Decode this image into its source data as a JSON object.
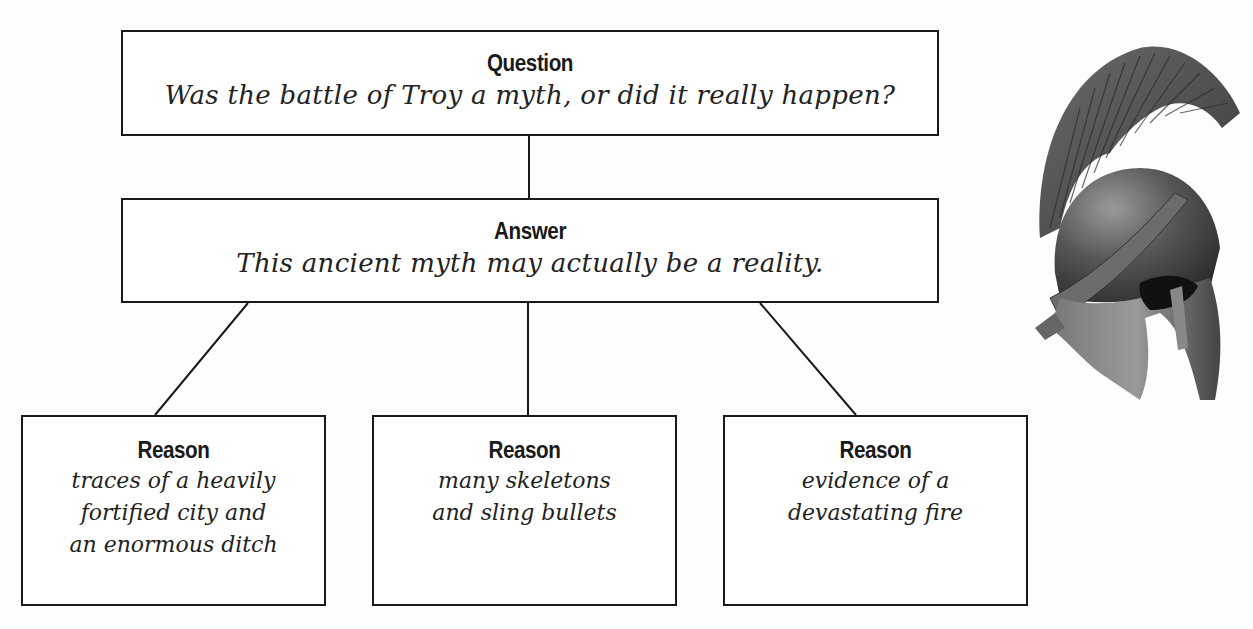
{
  "diagram": {
    "question": {
      "title": "Question",
      "text": "Was the battle of Troy a myth, or did it really happen?"
    },
    "answer": {
      "title": "Answer",
      "text": "This ancient myth may actually be a reality."
    },
    "reasons": [
      {
        "title": "Reason",
        "lines": [
          "traces of a heavily",
          "fortified city and",
          "an enormous ditch"
        ]
      },
      {
        "title": "Reason",
        "lines": [
          "many skeletons",
          "and sling bullets"
        ]
      },
      {
        "title": "Reason",
        "lines": [
          "evidence of a",
          "devastating fire"
        ]
      }
    ],
    "illustration": "greek-helmet-icon",
    "colors": {
      "line": "#1a1a1a",
      "box_fill": "#ffffff",
      "background": "#fdfdfd"
    }
  }
}
